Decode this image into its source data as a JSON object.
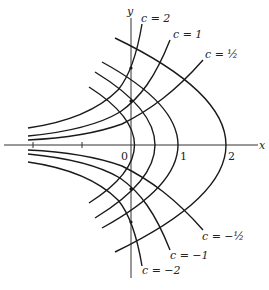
{
  "figure": {
    "axes": {
      "x_label": "x",
      "y_label": "y",
      "origin_label": "0",
      "x_ticks": [
        "1",
        "2"
      ]
    },
    "family_labels": [
      {
        "id": "c2",
        "text": "c = 2"
      },
      {
        "id": "c1",
        "text": "c = 1"
      },
      {
        "id": "chalf",
        "text": "c = ½"
      },
      {
        "id": "cmhalf",
        "text": "c = −½"
      },
      {
        "id": "cm1",
        "text": "c = −1"
      },
      {
        "id": "cm2",
        "text": "c = −2"
      }
    ],
    "family_c_values": [
      2,
      1,
      0.5,
      -0.5,
      -1,
      -2
    ],
    "trajectory_vertices_x": [
      0.07,
      0.5,
      1,
      2
    ],
    "colors": {
      "stroke": "#1a1a1a",
      "background": "#ffffff"
    }
  }
}
